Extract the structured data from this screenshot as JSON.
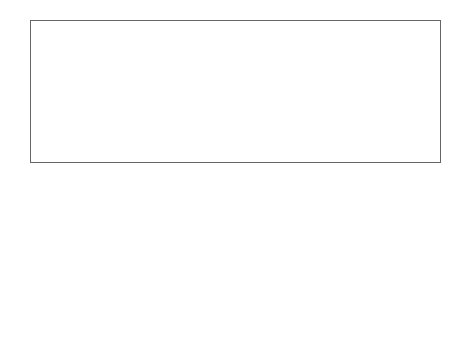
{
  "diagram": {
    "segments": {
      "anterior": "anterior segment",
      "posterior": "posterior segment"
    },
    "left_labels": [
      "ciliary body",
      "lens",
      "iris",
      "cornea",
      "pupil",
      "aqueous",
      "conjunctiva",
      "sclera"
    ],
    "right_labels": [
      "choroid",
      "retina",
      "macula",
      "optic nerve"
    ],
    "light_label": "LIGHT",
    "center_label": "Vitreous",
    "colors": {
      "frame": "#666666",
      "vitreous": "#c8c8c8",
      "choroid": "#555555",
      "sclera": "#e6e6e6",
      "lens": "#eeeeee"
    }
  }
}
